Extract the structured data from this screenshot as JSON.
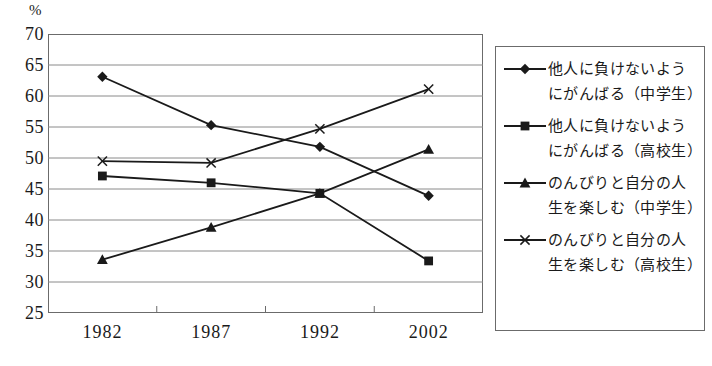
{
  "chart_data": {
    "type": "line",
    "title": "",
    "xlabel": "",
    "ylabel": "%",
    "unit_label": "%",
    "categories": [
      "1982",
      "1987",
      "1992",
      "2002"
    ],
    "ylim": [
      25,
      70
    ],
    "yticks": [
      70,
      65,
      60,
      55,
      50,
      45,
      40,
      35,
      30,
      25
    ],
    "grid": true,
    "legend_position": "right",
    "series": [
      {
        "name": "他人に負けないよう\nにがんばる（中学生）",
        "marker": "diamond",
        "values": [
          63.1,
          55.3,
          51.8,
          43.9
        ]
      },
      {
        "name": "他人に負けないよう\nにがんばる（高校生）",
        "marker": "square",
        "values": [
          47.1,
          46.0,
          44.3,
          33.4
        ]
      },
      {
        "name": "のんびりと自分の人\n生を楽しむ（中学生）",
        "marker": "triangle",
        "values": [
          33.6,
          38.8,
          44.3,
          51.4
        ]
      },
      {
        "name": "のんびりと自分の人\n生を楽しむ（高校生）",
        "marker": "cross",
        "values": [
          49.5,
          49.2,
          54.7,
          61.1
        ]
      }
    ]
  },
  "colors": {
    "line": "#1a1a1a",
    "frame": "#6b6b6b",
    "grid": "#8a8a8a",
    "background": "#ffffff"
  }
}
